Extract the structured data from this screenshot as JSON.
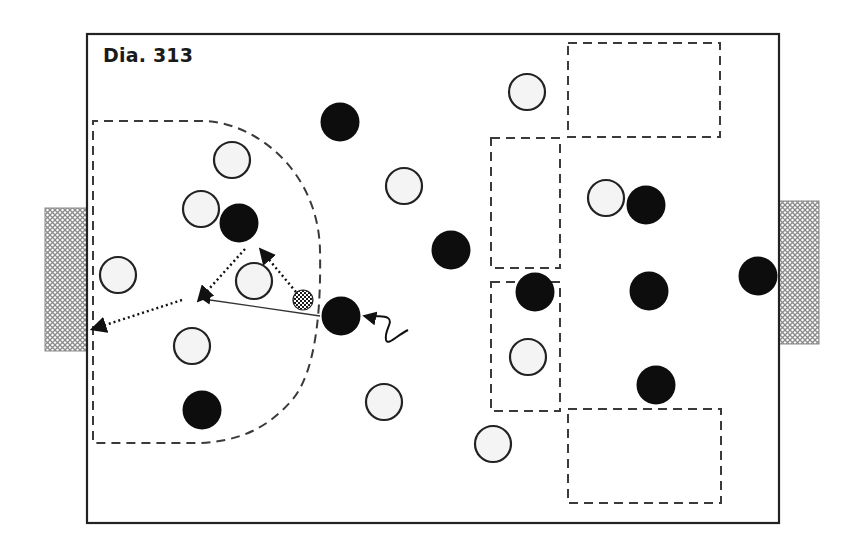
{
  "title": "Dia. 313",
  "colors": {
    "line": "#222222",
    "dash": "#3a3a3a",
    "white_player_fill": "#f4f4f4",
    "black_player_fill": "#0d0d0d",
    "goal_hatch": "#8a8a8a"
  },
  "field": {
    "x": 87,
    "y": 34,
    "width": 692,
    "height": 489
  },
  "goals": [
    {
      "id": "left-goal",
      "x": 45,
      "y": 208,
      "width": 42,
      "height": 143
    },
    {
      "id": "right-goal",
      "x": 779,
      "y": 201,
      "width": 40,
      "height": 143
    }
  ],
  "zones": [
    {
      "id": "top-right-zone",
      "x": 568,
      "y": 43,
      "width": 152,
      "height": 94
    },
    {
      "id": "mid-upper-zone",
      "x": 491,
      "y": 138,
      "width": 69,
      "height": 130
    },
    {
      "id": "mid-lower-zone",
      "x": 491,
      "y": 282,
      "width": 69,
      "height": 129
    },
    {
      "id": "bottom-right-zone",
      "x": 568,
      "y": 409,
      "width": 153,
      "height": 94
    }
  ],
  "penalty_area": {
    "id": "left-dashed-area"
  },
  "white_players": [
    {
      "x": 232,
      "y": 160
    },
    {
      "x": 201,
      "y": 209
    },
    {
      "x": 118,
      "y": 275
    },
    {
      "x": 254,
      "y": 281
    },
    {
      "x": 192,
      "y": 346
    },
    {
      "x": 404,
      "y": 186
    },
    {
      "x": 384,
      "y": 402
    },
    {
      "x": 527,
      "y": 92
    },
    {
      "x": 606,
      "y": 198
    },
    {
      "x": 528,
      "y": 357
    },
    {
      "x": 493,
      "y": 444
    }
  ],
  "black_players": [
    {
      "x": 340,
      "y": 122
    },
    {
      "x": 239,
      "y": 223
    },
    {
      "x": 451,
      "y": 250
    },
    {
      "x": 341,
      "y": 316
    },
    {
      "x": 202,
      "y": 410
    },
    {
      "x": 646,
      "y": 205
    },
    {
      "x": 535,
      "y": 292
    },
    {
      "x": 649,
      "y": 291
    },
    {
      "x": 656,
      "y": 385
    },
    {
      "x": 758,
      "y": 276
    }
  ],
  "ball": {
    "x": 303,
    "y": 300
  },
  "movements": [
    {
      "type": "pass-solid",
      "from": [
        320,
        316
      ],
      "to": [
        203,
        299
      ]
    },
    {
      "type": "run-dotted",
      "from": [
        245,
        249
      ],
      "to": [
        199,
        300
      ]
    },
    {
      "type": "run-dotted",
      "from": [
        296,
        292
      ],
      "to": [
        261,
        250
      ]
    },
    {
      "type": "run-dotted",
      "from": [
        182,
        300
      ],
      "to": [
        93,
        329
      ]
    },
    {
      "type": "dribble-wavy",
      "from": [
        408,
        330
      ],
      "to": [
        365,
        316
      ]
    }
  ]
}
